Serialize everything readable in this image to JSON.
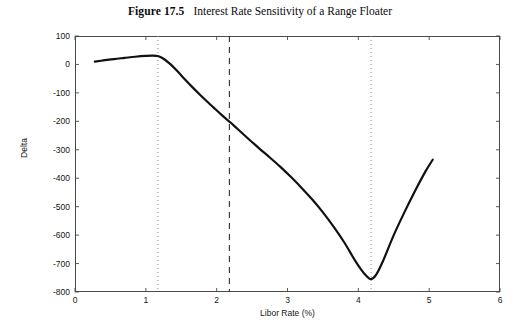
{
  "figure": {
    "number_label": "Figure 17.5",
    "caption": "Interest Rate Sensitivity of a Range Floater"
  },
  "chart_data": {
    "type": "line",
    "title": "Interest Rate Sensitivity of a Range Floater",
    "xlabel": "Libor Rate (%)",
    "ylabel": "Delta",
    "xlim": [
      0,
      6
    ],
    "ylim": [
      -800,
      100
    ],
    "xticks": [
      0,
      1,
      2,
      3,
      4,
      5,
      6
    ],
    "yticks": [
      100,
      0,
      -100,
      -200,
      -300,
      -400,
      -500,
      -600,
      -700,
      -800
    ],
    "xtick_labels": [
      "0",
      "1",
      "2",
      "3",
      "4",
      "5",
      "6"
    ],
    "ytick_labels": [
      "100",
      "0",
      "-100",
      "-200",
      "-300",
      "-400",
      "-500",
      "-600",
      "-700",
      "-800"
    ],
    "grid": false,
    "legend": null,
    "line_color": "#111111",
    "line_width": 2.2,
    "series": [
      {
        "name": "Delta",
        "x": [
          0.28,
          0.4,
          0.55,
          0.7,
          0.85,
          1.0,
          1.1,
          1.18,
          1.25,
          1.35,
          1.45,
          1.55,
          1.65,
          1.75,
          1.85,
          1.95,
          2.05,
          2.15,
          2.2,
          2.3,
          2.45,
          2.6,
          2.75,
          2.9,
          3.05,
          3.2,
          3.35,
          3.5,
          3.65,
          3.8,
          3.95,
          4.05,
          4.12,
          4.18,
          4.25,
          4.35,
          4.5,
          4.65,
          4.8,
          4.95,
          5.05
        ],
        "y": [
          10,
          14,
          19,
          23,
          27,
          30,
          31,
          29,
          20,
          0,
          -25,
          -52,
          -78,
          -103,
          -127,
          -150,
          -173,
          -195,
          -205,
          -228,
          -262,
          -295,
          -327,
          -360,
          -396,
          -434,
          -475,
          -520,
          -570,
          -625,
          -688,
          -725,
          -745,
          -755,
          -740,
          -690,
          -600,
          -520,
          -445,
          -375,
          -335
        ]
      }
    ],
    "annotations": [
      {
        "name": "lower-barrier-marker",
        "type": "vline",
        "x": 1.17,
        "style": "dotted",
        "color": "#8f8f8f"
      },
      {
        "name": "current-rate-marker",
        "type": "vline",
        "x": 2.18,
        "style": "dashed",
        "color": "#3d3d3d"
      },
      {
        "name": "upper-barrier-marker",
        "type": "vline",
        "x": 4.18,
        "style": "dotted",
        "color": "#8f8f8f"
      }
    ]
  },
  "colors": {
    "axis": "#4a4a4a",
    "curve": "#111111",
    "dotted_marker": "#8f8f8f",
    "dashed_marker": "#3d3d3d",
    "background": "#ffffff"
  }
}
